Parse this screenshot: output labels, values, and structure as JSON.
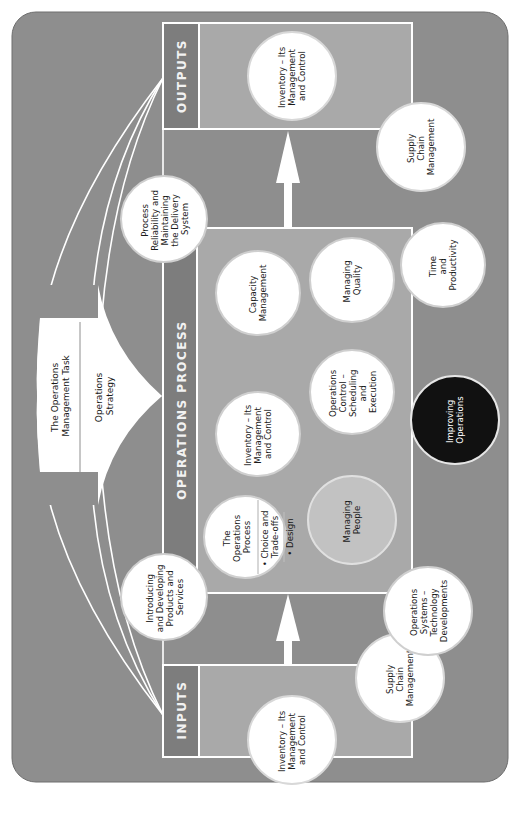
{
  "diagram": {
    "orientation": "rotated 90 degrees counter-clockwise",
    "colors": {
      "background": "#8e8e8e",
      "box_fill": "#a9a9a9",
      "header_strip": "#7d7d7d",
      "circle": "#ffffff",
      "circle_highlight": "#c2c2c2",
      "circle_dark": "#111111",
      "lines": "#ffffff"
    },
    "inputs": {
      "header": "INPUTS",
      "circles": [
        {
          "lines": [
            "Inventory – Its",
            "Management",
            "and Control"
          ]
        }
      ],
      "adjacent_circle": {
        "lines": [
          "Supply",
          "Chain",
          "Management"
        ]
      }
    },
    "outputs": {
      "header": "OUTPUTS",
      "circles": [
        {
          "lines": [
            "Inventory – Its",
            "Management",
            "and Control"
          ]
        }
      ],
      "adjacent_circle": {
        "lines": [
          "Supply",
          "Chain",
          "Management"
        ]
      }
    },
    "management_task": {
      "title_lines": [
        "The Operations",
        "Management Task"
      ],
      "strategy_lines": [
        "Operations",
        "Strategy"
      ]
    },
    "linked_circles": {
      "introducing": {
        "lines": [
          "Introducing",
          "and Developing",
          "Products and",
          "Services"
        ]
      },
      "reliability": {
        "lines": [
          "Process",
          "Reliability and",
          "Maintaining",
          "the Delivery",
          "System"
        ]
      },
      "systems_tech": {
        "lines": [
          "Operations",
          "Systems –",
          "Technology",
          "Developments"
        ]
      },
      "time_productivity": {
        "lines": [
          "Time",
          "and",
          "Productivity"
        ]
      }
    },
    "operations_process": {
      "header": "OPERATIONS PROCESS",
      "circles": {
        "the_process": {
          "lines": [
            "The",
            "Operations",
            "Process"
          ],
          "bullets": [
            "• Choice and",
            "Trade-offs",
            "• Design"
          ]
        },
        "inventory": {
          "lines": [
            "Inventory – Its",
            "Management",
            "and Control"
          ]
        },
        "capacity": {
          "lines": [
            "Capacity",
            "Management"
          ]
        },
        "managing_people": {
          "lines": [
            "Managing",
            "People"
          ]
        },
        "ops_control": {
          "lines": [
            "Operations",
            "Control –",
            "Scheduling",
            "and",
            "Execution"
          ]
        },
        "managing_quality": {
          "lines": [
            "Managing",
            "Quality"
          ]
        }
      }
    },
    "improving": {
      "lines": [
        "Improving",
        "Operations"
      ]
    }
  }
}
